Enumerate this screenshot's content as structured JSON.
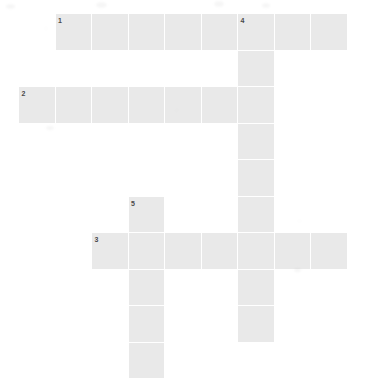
{
  "puzzle": {
    "kind": "crossword-grid",
    "title": "Crossword puzzle grid",
    "canvas": {
      "width": 384,
      "height": 356,
      "background": "#ffffff"
    },
    "cell": {
      "size": 36.5,
      "gap": 1,
      "fill": "#e9e9e9",
      "number_color": "#4a4a4a",
      "number_font_size": 7
    },
    "origin": {
      "x": 19,
      "y": 14
    },
    "entries": [
      {
        "number": "1",
        "direction": "across",
        "start_col": 1,
        "start_row": 0,
        "length": 8,
        "label": "1 Across"
      },
      {
        "number": "2",
        "direction": "across",
        "start_col": 0,
        "start_row": 2,
        "length": 7,
        "label": "2 Across"
      },
      {
        "number": "3",
        "direction": "across",
        "start_col": 2,
        "start_row": 6,
        "length": 7,
        "label": "3 Across"
      },
      {
        "number": "4",
        "direction": "down",
        "start_col": 6,
        "start_row": 0,
        "length": 9,
        "label": "4 Down"
      },
      {
        "number": "5",
        "direction": "down",
        "start_col": 3,
        "start_row": 5,
        "length": 5,
        "label": "5 Down"
      }
    ],
    "numbered_cells": [
      {
        "number": "1",
        "col": 1,
        "row": 0
      },
      {
        "number": "4",
        "col": 6,
        "row": 0
      },
      {
        "number": "2",
        "col": 0,
        "row": 2
      },
      {
        "number": "5",
        "col": 3,
        "row": 5
      },
      {
        "number": "3",
        "col": 2,
        "row": 6
      }
    ],
    "cells": [
      {
        "col": 1,
        "row": 0
      },
      {
        "col": 2,
        "row": 0
      },
      {
        "col": 3,
        "row": 0
      },
      {
        "col": 4,
        "row": 0
      },
      {
        "col": 5,
        "row": 0
      },
      {
        "col": 6,
        "row": 0
      },
      {
        "col": 7,
        "row": 0
      },
      {
        "col": 8,
        "row": 0
      },
      {
        "col": 6,
        "row": 1
      },
      {
        "col": 0,
        "row": 2
      },
      {
        "col": 1,
        "row": 2
      },
      {
        "col": 2,
        "row": 2
      },
      {
        "col": 3,
        "row": 2
      },
      {
        "col": 4,
        "row": 2
      },
      {
        "col": 5,
        "row": 2
      },
      {
        "col": 6,
        "row": 2
      },
      {
        "col": 6,
        "row": 3
      },
      {
        "col": 6,
        "row": 4
      },
      {
        "col": 3,
        "row": 5
      },
      {
        "col": 6,
        "row": 5
      },
      {
        "col": 2,
        "row": 6
      },
      {
        "col": 3,
        "row": 6
      },
      {
        "col": 4,
        "row": 6
      },
      {
        "col": 5,
        "row": 6
      },
      {
        "col": 6,
        "row": 6
      },
      {
        "col": 7,
        "row": 6
      },
      {
        "col": 8,
        "row": 6
      },
      {
        "col": 3,
        "row": 7
      },
      {
        "col": 6,
        "row": 7
      },
      {
        "col": 3,
        "row": 8
      },
      {
        "col": 6,
        "row": 8
      },
      {
        "col": 3,
        "row": 9
      }
    ]
  }
}
